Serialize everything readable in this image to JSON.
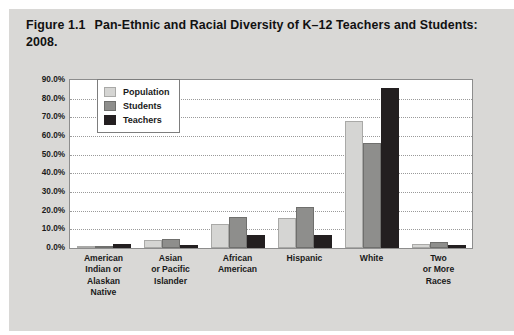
{
  "figure": {
    "label": "Figure 1.1",
    "title": "Pan-Ethnic and Racial Diversity of K–12 Teachers and Students: 2008."
  },
  "chart_data": {
    "type": "bar",
    "title": "Pan-Ethnic and Racial Diversity of K–12 Teachers and Students: 2008.",
    "xlabel": "",
    "ylabel": "",
    "ylim": [
      0,
      90
    ],
    "ytick_labels": [
      "90.0%",
      "80.0%",
      "70.0%",
      "60.0%",
      "50.0%",
      "40.0%",
      "30.0%",
      "20.0%",
      "10.0%",
      "0.0%"
    ],
    "ytick_values": [
      90,
      80,
      70,
      60,
      50,
      40,
      30,
      20,
      10,
      0
    ],
    "grid": true,
    "legend_position": "top-left-inside",
    "categories": [
      "American Indian or Alaskan Native",
      "Asian or Pacific Islander",
      "African American",
      "Hispanic",
      "White",
      "Two or More Races"
    ],
    "category_lines": [
      [
        "American",
        "Indian or",
        "Alaskan",
        "Native"
      ],
      [
        "Asian",
        "or Pacific",
        "Islander"
      ],
      [
        "African",
        "American"
      ],
      [
        "Hispanic"
      ],
      [
        "White"
      ],
      [
        "Two",
        "or More",
        "Races"
      ]
    ],
    "series": [
      {
        "name": "Population",
        "color": "#d5d5d3",
        "values": [
          1.0,
          4.5,
          13.0,
          16.0,
          68.0,
          2.0
        ]
      },
      {
        "name": "Students",
        "color": "#8e8e8c",
        "values": [
          1.2,
          4.8,
          16.5,
          22.0,
          56.5,
          3.0
        ]
      },
      {
        "name": "Teachers",
        "color": "#231f20",
        "values": [
          2.0,
          1.5,
          7.0,
          7.0,
          85.5,
          1.5
        ]
      }
    ]
  }
}
